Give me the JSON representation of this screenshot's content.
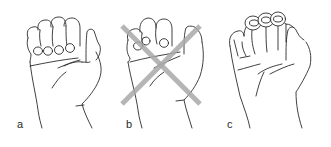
{
  "figure": {
    "panels": [
      {
        "id": "a",
        "label": "a",
        "crossed_out": false
      },
      {
        "id": "b",
        "label": "b",
        "crossed_out": true
      },
      {
        "id": "c",
        "label": "c",
        "crossed_out": false
      }
    ],
    "colors": {
      "line": "#2b2b2b",
      "cross": "#a9a9a9",
      "background": "#ffffff"
    }
  }
}
